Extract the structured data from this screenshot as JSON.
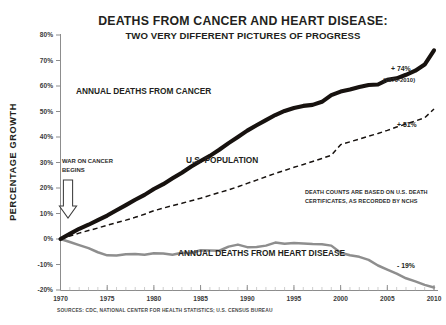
{
  "chart_data": {
    "type": "line",
    "title": "DEATHS FROM CANCER AND HEART DISEASE:",
    "subtitle": "TWO VERY DIFFERENT PICTURES OF PROGRESS",
    "xlabel": "",
    "ylabel": "PERCENTAGE GROWTH",
    "xlim": [
      1970,
      2010
    ],
    "ylim": [
      -20,
      80
    ],
    "ytick_labels": [
      "80%",
      "70%",
      "60%",
      "50%",
      "40%",
      "30%",
      "20%",
      "10%",
      "0%",
      "-10%",
      "-20%"
    ],
    "ytick_values": [
      80,
      70,
      60,
      50,
      40,
      30,
      20,
      10,
      0,
      -10,
      -20
    ],
    "xtick_labels": [
      "1970",
      "1975",
      "1980",
      "1985",
      "1990",
      "1995",
      "2000",
      "2005",
      "2010"
    ],
    "xtick_values": [
      1970,
      1975,
      1980,
      1985,
      1990,
      1995,
      2000,
      2005,
      2010
    ],
    "grid": false,
    "legend_position": "inline-labels",
    "x": [
      1970,
      1971,
      1972,
      1973,
      1974,
      1975,
      1976,
      1977,
      1978,
      1979,
      1980,
      1981,
      1982,
      1983,
      1984,
      1985,
      1986,
      1987,
      1988,
      1989,
      1990,
      1991,
      1992,
      1993,
      1994,
      1995,
      1996,
      1997,
      1998,
      1999,
      2000,
      2001,
      2002,
      2003,
      2004,
      2005,
      2006,
      2007,
      2008,
      2009,
      2010
    ],
    "series": [
      {
        "name": "ANNUAL DEATHS FROM CANCER",
        "color": "#17120f",
        "style": "thick-solid",
        "end_label": "+ 74%",
        "end_sublabel": "(1970-2010)",
        "values": [
          0,
          2.0,
          4.0,
          5.6,
          7.4,
          9.2,
          11.3,
          13.3,
          15.4,
          17.3,
          19.6,
          21.5,
          23.8,
          26.0,
          28.4,
          30.6,
          32.6,
          35.0,
          37.6,
          40.0,
          42.5,
          44.6,
          46.6,
          48.6,
          50.2,
          51.4,
          52.2,
          52.6,
          53.8,
          56.4,
          57.8,
          58.6,
          59.6,
          60.4,
          60.6,
          62.4,
          63.0,
          64.4,
          66.0,
          68.4,
          74.0
        ]
      },
      {
        "name": "U.S. POPULATION",
        "color": "#17120f",
        "style": "dashed",
        "end_label": "+ 51%",
        "values": [
          0,
          1.2,
          2.3,
          3.3,
          4.3,
          5.4,
          6.4,
          7.4,
          8.5,
          9.7,
          11.1,
          12.1,
          13.1,
          14.0,
          15.0,
          16.0,
          17.1,
          18.2,
          19.3,
          20.5,
          21.8,
          23.1,
          24.4,
          25.7,
          26.9,
          28.1,
          29.2,
          30.4,
          31.6,
          32.8,
          37.0,
          38.1,
          39.2,
          40.3,
          41.4,
          42.6,
          43.9,
          45.1,
          46.3,
          47.5,
          51.0
        ]
      },
      {
        "name": "ANNUAL DEATHS FROM HEART DISEASE",
        "color": "#8e8e8e",
        "style": "medium-solid",
        "end_label": "- 19%",
        "values": [
          0,
          -1.2,
          -2.4,
          -3.6,
          -5.2,
          -6.4,
          -6.5,
          -6.0,
          -5.9,
          -6.2,
          -5.6,
          -5.7,
          -6.2,
          -5.4,
          -5.5,
          -4.4,
          -4.5,
          -4.6,
          -3.0,
          -2.2,
          -3.2,
          -3.1,
          -2.6,
          -1.4,
          -1.9,
          -1.6,
          -1.8,
          -2.0,
          -2.1,
          -2.6,
          -5.4,
          -6.4,
          -7.0,
          -8.2,
          -10.4,
          -12.0,
          -13.6,
          -15.4,
          -16.6,
          -18.0,
          -19.0
        ]
      }
    ],
    "annotations": [
      {
        "name": "war-on-cancer",
        "line1": "WAR ON CANCER",
        "line2": "BEGINS",
        "icon": "down-arrow-icon"
      },
      {
        "name": "death-counts-note",
        "line1": "DEATH COUNTS ARE BASED ON U.S. DEATH",
        "line2": "CERTIFICATES, AS RECORDED BY NCHS"
      }
    ],
    "source": "SOURCES:  CDC, NATIONAL CENTER FOR HEALTH STATISTICS; U.S. CENSUS BUREAU"
  },
  "labels": {
    "cancer_series": "ANNUAL DEATHS FROM CANCER",
    "population_series": "U.S. POPULATION",
    "heart_series": "ANNUAL DEATHS FROM HEART DISEASE",
    "cancer_growth": "+ 74%",
    "cancer_growth_period": "(1970-2010)",
    "population_growth": "+ 51%",
    "heart_growth": "- 19%",
    "war_line1": "WAR ON CANCER",
    "war_line2": "BEGINS",
    "note_line1": "DEATH COUNTS ARE BASED ON U.S. DEATH",
    "note_line2": "CERTIFICATES, AS RECORDED BY NCHS",
    "y_axis_title": "PERCENTAGE GROWTH",
    "source": "SOURCES:  CDC, NATIONAL CENTER FOR HEALTH STATISTICS; U.S. CENSUS BUREAU",
    "title_main": "DEATHS FROM CANCER AND HEART DISEASE:",
    "title_sub": "TWO VERY DIFFERENT PICTURES OF PROGRESS"
  },
  "colors": {
    "cancer": "#17120f",
    "population": "#17120f",
    "heart": "#8e8e8e",
    "axis": "#8d8d8d",
    "text": "#231f20",
    "background": "#ffffff"
  }
}
